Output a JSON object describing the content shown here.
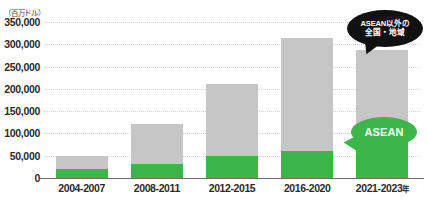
{
  "chart_data": {
    "type": "bar",
    "title": "",
    "subtitle": "",
    "unit_label": "（百万ドル）",
    "xlabel": "",
    "ylabel": "",
    "ylim": [
      0,
      350000
    ],
    "grid": true,
    "stacked": true,
    "legend_position": "callout-annotations",
    "categories": [
      "2004-2007",
      "2008-2011",
      "2012-2015",
      "2016-2020",
      "2021-2023年"
    ],
    "ytick_labels": [
      "350,000",
      "300,000",
      "250,000",
      "200,000",
      "150,000",
      "100,000",
      "50,000",
      "0"
    ],
    "ytick_values": [
      350000,
      300000,
      250000,
      200000,
      150000,
      100000,
      50000,
      0
    ],
    "series": [
      {
        "name": "ASEAN",
        "color": "#3cb54a",
        "values": [
          20000,
          32000,
          50000,
          60000,
          90000
        ]
      },
      {
        "name": "ASEAN以外の全国・地域",
        "color": "#c6c6c6",
        "values": [
          30000,
          90000,
          160000,
          255000,
          198000
        ]
      }
    ],
    "totals": [
      50000,
      122000,
      210000,
      315000,
      288000
    ],
    "annotations": [
      {
        "id": "other-regions",
        "text_lines": [
          "ASEAN以外の",
          "全国・地域"
        ],
        "style": "dark-bubble",
        "color": "#111111",
        "text_color": "#ffffff"
      },
      {
        "id": "asean",
        "text_lines": [
          "ASEAN"
        ],
        "style": "green-bubble",
        "color": "#3cb54a",
        "text_color": "#ffffff"
      }
    ]
  },
  "colors": {
    "asean": "#3cb54a",
    "other": "#c6c6c6",
    "grid": "#d2d2d2",
    "axis": "#6d6d6d",
    "text": "#2b2b2b",
    "background": "#ffffff"
  }
}
